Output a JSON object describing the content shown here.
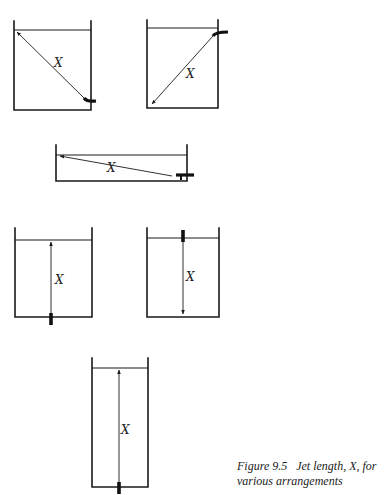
{
  "figure": {
    "caption_label": "Figure 9.5",
    "caption_text": "Jet length, X, for various arrangements",
    "jet_symbol": "X",
    "arrangements": [
      {
        "id": "tank-1",
        "description": "nozzle at bottom-right corner, jet diagonal to top-left surface",
        "label": "X"
      },
      {
        "id": "tank-2",
        "description": "nozzle at top-right near surface, jet diagonal to bottom-left",
        "label": "X"
      },
      {
        "id": "tank-3",
        "description": "shallow long tank, nozzle at bottom-right, jet shallow diagonal to surface at left",
        "label": "X"
      },
      {
        "id": "tank-4",
        "description": "nozzle in floor centre, jet vertical upward to surface",
        "label": "X"
      },
      {
        "id": "tank-5",
        "description": "nozzle at surface centre, jet vertical downward to floor",
        "label": "X"
      },
      {
        "id": "tank-6",
        "description": "tall narrow tank, nozzle in floor centre, jet vertical upward to surface",
        "label": "X"
      }
    ]
  }
}
